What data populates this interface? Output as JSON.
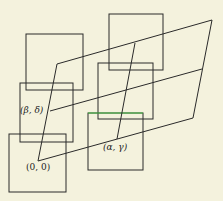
{
  "diagram": {
    "background": "#f4f2dd",
    "stroke": "#2a2a2a",
    "accent_edge": "#44c144",
    "labels": {
      "origin": "(0, 0)",
      "beta_delta": "(β, δ)",
      "alpha_gamma": "(α, γ)"
    },
    "squares": [
      {
        "x": 26,
        "y": 34,
        "w": 57,
        "h": 56
      },
      {
        "x": 20,
        "y": 83,
        "w": 53,
        "h": 59
      },
      {
        "x": 9,
        "y": 134,
        "w": 57,
        "h": 58
      },
      {
        "x": 109,
        "y": 14,
        "w": 54,
        "h": 56
      },
      {
        "x": 98,
        "y": 63,
        "w": 55,
        "h": 56
      },
      {
        "x": 88,
        "y": 113,
        "w": 55,
        "h": 57
      }
    ],
    "parallelogram": {
      "origin": [
        38,
        161
      ],
      "top_left": [
        57,
        64
      ],
      "top_right": [
        212,
        20
      ],
      "bottom_right": [
        193,
        118
      ]
    }
  }
}
